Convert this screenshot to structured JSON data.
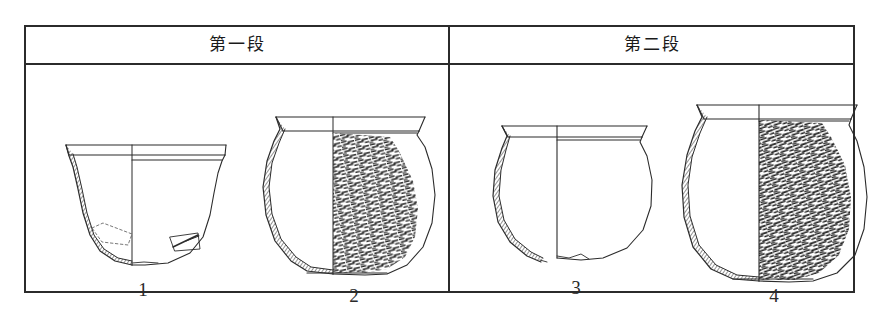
{
  "figure": {
    "type": "archaeological-pottery-typology-table",
    "background_color": "#ffffff",
    "ink_color": "#2b2b2b",
    "border_width_px": 2
  },
  "table": {
    "columns": [
      {
        "id": "col-1",
        "header": "第一段"
      },
      {
        "id": "col-2",
        "header": "第二段"
      }
    ]
  },
  "vessels": [
    {
      "number": "1",
      "column": "第一段",
      "form": "wide-mouth basin with broad everted flat rim",
      "profile": "half-section drawing: left half cross-section with hatched wall, right half exterior elevation",
      "surface": "plain / undecorated exterior",
      "base": "rounded to slightly flattened base",
      "rim_style": "wide flat everted rim band"
    },
    {
      "number": "2",
      "column": "第一段",
      "form": "globular jar with everted rim and short neck",
      "profile": "half-section drawing: left half cross-section with hatched wall, right half exterior elevation",
      "surface": "dense cord-marked / textured body on exterior half",
      "base": "flat base",
      "rim_style": "everted thickened rim"
    },
    {
      "number": "3",
      "column": "第二段",
      "form": "wide-mouth jar with broad everted flat rim",
      "profile": "half-section drawing: left half cross-section with hatched wall, right half exterior elevation",
      "surface": "plain / undecorated exterior",
      "base": "rounded base, partially restored outline",
      "rim_style": "wide flat everted rim band"
    },
    {
      "number": "4",
      "column": "第二段",
      "form": "tall globular jar with everted rim",
      "profile": "half-section drawing: left half cross-section with hatched wall, right half exterior elevation",
      "surface": "dense cord-marked / textured body on exterior half",
      "base": "flat base",
      "rim_style": "everted thickened rim"
    }
  ]
}
